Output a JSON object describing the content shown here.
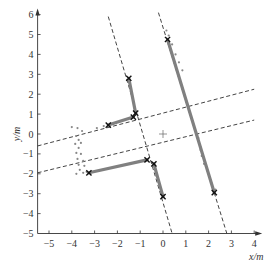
{
  "chart_data": {
    "type": "scatter",
    "title": "",
    "xlabel": "x/m",
    "ylabel": "y/m",
    "xlim": [
      -5.5,
      4
    ],
    "ylim": [
      -5,
      6
    ],
    "x_ticks": [
      -5,
      -4,
      -3,
      -2,
      -1,
      0,
      1,
      2,
      3,
      4
    ],
    "y_ticks": [
      -5,
      -4,
      -3,
      -2,
      -1,
      0,
      1,
      2,
      3,
      4,
      5,
      6
    ],
    "grid": false,
    "legend": null,
    "origin_marker": {
      "x": 0,
      "y": 0,
      "symbol": "+"
    },
    "dashed_lines": [
      {
        "name": "left-steep",
        "x1": -2.4,
        "y1": 5.9,
        "x2": 0.4,
        "y2": -5.0
      },
      {
        "name": "right-steep",
        "x1": -0.2,
        "y1": 6.1,
        "x2": 2.8,
        "y2": -5.0
      },
      {
        "name": "upper-shallow",
        "x1": -5.5,
        "y1": -0.6,
        "x2": 4.0,
        "y2": 2.25
      },
      {
        "name": "lower-shallow",
        "x1": -5.5,
        "y1": -1.95,
        "x2": 4.0,
        "y2": 0.7
      }
    ],
    "segments": [
      {
        "name": "seg-upper-left-vertical",
        "x1": -1.5,
        "y1": 2.8,
        "x2": -1.2,
        "y2": 1.05
      },
      {
        "name": "seg-upper-left-horizontal",
        "x1": -2.4,
        "y1": 0.45,
        "x2": -1.3,
        "y2": 0.85
      },
      {
        "name": "seg-lower-left-horizontal",
        "x1": -3.25,
        "y1": -1.95,
        "x2": -0.7,
        "y2": -1.3
      },
      {
        "name": "seg-lower-vertical",
        "x1": -0.4,
        "y1": -1.5,
        "x2": 0.0,
        "y2": -3.15
      },
      {
        "name": "seg-right-long",
        "x1": 0.2,
        "y1": 4.75,
        "x2": 2.25,
        "y2": -2.95
      }
    ],
    "x_markers": [
      {
        "x": -1.5,
        "y": 2.8
      },
      {
        "x": -1.2,
        "y": 1.05
      },
      {
        "x": -1.3,
        "y": 0.85
      },
      {
        "x": -2.4,
        "y": 0.45
      },
      {
        "x": -3.25,
        "y": -1.95
      },
      {
        "x": -0.7,
        "y": -1.3
      },
      {
        "x": -0.4,
        "y": -1.5
      },
      {
        "x": 0.0,
        "y": -3.15
      },
      {
        "x": 0.2,
        "y": 4.75
      },
      {
        "x": 2.25,
        "y": -2.95
      }
    ],
    "scatter_points": [
      {
        "x": -4.0,
        "y": 0.35
      },
      {
        "x": -3.75,
        "y": 0.3
      },
      {
        "x": -3.55,
        "y": 0.15
      },
      {
        "x": -3.8,
        "y": -0.1
      },
      {
        "x": -3.7,
        "y": -0.3
      },
      {
        "x": -3.6,
        "y": -0.45
      },
      {
        "x": -3.85,
        "y": -0.5
      },
      {
        "x": -3.7,
        "y": -0.7
      },
      {
        "x": -3.8,
        "y": -0.95
      },
      {
        "x": -3.6,
        "y": -1.0
      },
      {
        "x": -3.75,
        "y": -1.25
      },
      {
        "x": -3.5,
        "y": -1.35
      },
      {
        "x": -3.7,
        "y": -1.55
      },
      {
        "x": -3.45,
        "y": -1.6
      },
      {
        "x": -3.65,
        "y": -1.8
      },
      {
        "x": -3.5,
        "y": -1.95
      },
      {
        "x": -3.8,
        "y": -2.0
      },
      {
        "x": -3.35,
        "y": -1.9
      },
      {
        "x": -2.2,
        "y": 0.5
      },
      {
        "x": -2.6,
        "y": 0.4
      },
      {
        "x": -2.9,
        "y": 0.3
      },
      {
        "x": 0.15,
        "y": 5.2
      },
      {
        "x": 0.25,
        "y": 4.95
      },
      {
        "x": 0.4,
        "y": 4.5
      },
      {
        "x": 0.55,
        "y": 4.0
      },
      {
        "x": 0.7,
        "y": 3.6
      },
      {
        "x": 0.85,
        "y": 3.2
      },
      {
        "x": 1.55,
        "y": -0.2
      },
      {
        "x": 1.65,
        "y": -0.8
      },
      {
        "x": 1.7,
        "y": -1.1
      },
      {
        "x": 1.8,
        "y": -1.5
      },
      {
        "x": 2.3,
        "y": -2.8
      }
    ]
  },
  "axes": {
    "x_label": "x/m",
    "y_label": "y/m",
    "x_tick_labels": [
      "−5",
      "−4",
      "−3",
      "−2",
      "−1",
      "0",
      "1",
      "2",
      "3",
      "4"
    ],
    "y_tick_labels": [
      "−5",
      "−4",
      "−3",
      "−2",
      "−1",
      "0",
      "1",
      "2",
      "3",
      "4",
      "5",
      "6"
    ]
  },
  "colors": {
    "axis": "#333333",
    "dashed": "#444444",
    "segment": "#808080",
    "marker": "#111111",
    "scatter": "#888888"
  }
}
